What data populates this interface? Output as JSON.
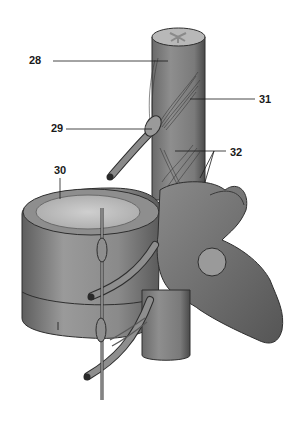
{
  "figure": {
    "colors": {
      "background": "#ffffff",
      "ink": "#1a1a1a",
      "bone_light": "#a8a8a8",
      "bone_mid": "#7a7a7a",
      "bone_dark": "#4a4a4a",
      "cord": "#858585",
      "disc_surface": "#c4c4c4"
    },
    "labels": [
      {
        "id": "28",
        "text": "28",
        "x": 29,
        "y": 54
      },
      {
        "id": "29",
        "text": "29",
        "x": 51,
        "y": 122
      },
      {
        "id": "30",
        "text": "30",
        "x": 54,
        "y": 164
      },
      {
        "id": "31",
        "text": "31",
        "x": 259,
        "y": 93
      },
      {
        "id": "32",
        "text": "32",
        "x": 230,
        "y": 146
      }
    ]
  }
}
